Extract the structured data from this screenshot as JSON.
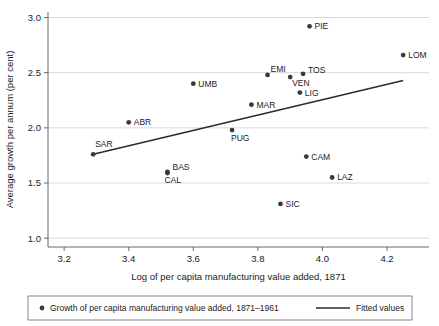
{
  "chart_data": {
    "type": "scatter",
    "title": "",
    "xlabel": "Log of per capita manufacturing value added, 1871",
    "ylabel": "Average growth per annum (per cent)",
    "xlim": [
      3.15,
      4.33
    ],
    "ylim": [
      0.92,
      3.05
    ],
    "xticks": [
      "3.2",
      "3.4",
      "3.6",
      "3.8",
      "4.0",
      "4.2"
    ],
    "xtick_values": [
      3.2,
      3.4,
      3.6,
      3.8,
      4.0,
      4.2
    ],
    "yticks": [
      "1.0",
      "1.5",
      "2.0",
      "2.5",
      "3.0"
    ],
    "ytick_values": [
      1.0,
      1.5,
      2.0,
      2.5,
      3.0
    ],
    "grid": "horizontal",
    "legend_position": "bottom",
    "points": [
      {
        "label": "SAR",
        "x": 3.29,
        "y": 1.76,
        "label_dx": 2,
        "label_dy": -7,
        "anchor": "start"
      },
      {
        "label": "ABR",
        "x": 3.4,
        "y": 2.05,
        "label_dx": 5,
        "label_dy": 3,
        "anchor": "start"
      },
      {
        "label": "BAS",
        "x": 3.52,
        "y": 1.6,
        "label_dx": 5,
        "label_dy": -2,
        "anchor": "start"
      },
      {
        "label": "CAL",
        "x": 3.52,
        "y": 1.59,
        "label_dx": -3,
        "label_dy": 10,
        "anchor": "start"
      },
      {
        "label": "UMB",
        "x": 3.6,
        "y": 2.4,
        "label_dx": 5,
        "label_dy": 3,
        "anchor": "start"
      },
      {
        "label": "PUG",
        "x": 3.72,
        "y": 1.98,
        "label_dx": -1,
        "label_dy": 11,
        "anchor": "start"
      },
      {
        "label": "MAR",
        "x": 3.78,
        "y": 2.21,
        "label_dx": 5,
        "label_dy": 3,
        "anchor": "start"
      },
      {
        "label": "EMI",
        "x": 3.83,
        "y": 2.48,
        "label_dx": 3,
        "label_dy": -3,
        "anchor": "start"
      },
      {
        "label": "SIC",
        "x": 3.87,
        "y": 1.31,
        "label_dx": 5,
        "label_dy": 3,
        "anchor": "start"
      },
      {
        "label": "VEN",
        "x": 3.9,
        "y": 2.46,
        "label_dx": 2,
        "label_dy": 9,
        "anchor": "start"
      },
      {
        "label": "LIG",
        "x": 3.93,
        "y": 2.32,
        "label_dx": 5,
        "label_dy": 3,
        "anchor": "start"
      },
      {
        "label": "TOS",
        "x": 3.94,
        "y": 2.49,
        "label_dx": 5,
        "label_dy": -1,
        "anchor": "start"
      },
      {
        "label": "CAM",
        "x": 3.95,
        "y": 1.74,
        "label_dx": 5,
        "label_dy": 3,
        "anchor": "start"
      },
      {
        "label": "PIE",
        "x": 3.96,
        "y": 2.92,
        "label_dx": 5,
        "label_dy": 3,
        "anchor": "start"
      },
      {
        "label": "LAZ",
        "x": 4.03,
        "y": 1.55,
        "label_dx": 5,
        "label_dy": 3,
        "anchor": "start"
      },
      {
        "label": "LOM",
        "x": 4.25,
        "y": 2.66,
        "label_dx": 5,
        "label_dy": 3,
        "anchor": "start"
      }
    ],
    "fitted_line": {
      "name": "Fitted values",
      "x_start": 3.29,
      "y_start": 1.76,
      "x_end": 4.25,
      "y_end": 2.43
    },
    "legend": {
      "scatter_label": "Growth of per capita manufacturing value added, 1871–1961",
      "line_label": "Fitted values"
    },
    "colors": {
      "marker": "#3a3a3a",
      "line": "#2b2b2b",
      "grid": "#c9c9c9",
      "axis": "#5a5a5a",
      "text": "#1b1b1b",
      "background": "#ffffff"
    }
  }
}
